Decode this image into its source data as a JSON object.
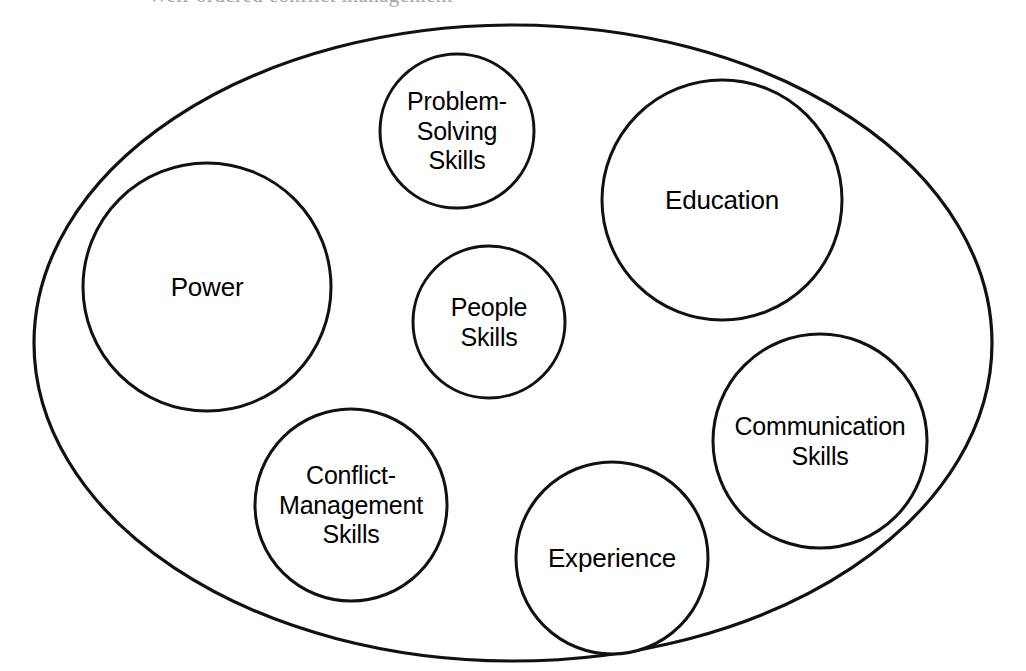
{
  "page": {
    "width": 1026,
    "height": 671,
    "background_color": "#ffffff",
    "stroke_color": "#111111",
    "text_color": "#000000",
    "clipped_header_text": "Well-ordered conflict management"
  },
  "chart_data": {
    "type": "diagram",
    "diagram_kind": "venn-containment",
    "title": "",
    "container": {
      "shape": "ellipse",
      "label": "",
      "cx": 513,
      "cy": 343,
      "rx": 479,
      "ry": 318,
      "stroke_width": 3.2
    },
    "nodes": [
      {
        "id": "power",
        "label": "Power",
        "shape": "circle",
        "cx": 207,
        "cy": 287,
        "r": 124,
        "font_size": 26,
        "stroke_width": 3.0
      },
      {
        "id": "problem-solving-skills",
        "label": "Problem-\nSolving\nSkills",
        "shape": "circle",
        "cx": 457,
        "cy": 131,
        "r": 77,
        "font_size": 25,
        "stroke_width": 3.0
      },
      {
        "id": "education",
        "label": "Education",
        "shape": "circle",
        "cx": 722,
        "cy": 200,
        "r": 120,
        "font_size": 26,
        "stroke_width": 3.0
      },
      {
        "id": "people-skills",
        "label": "People\nSkills",
        "shape": "circle",
        "cx": 489,
        "cy": 322,
        "r": 76,
        "font_size": 25,
        "stroke_width": 3.0
      },
      {
        "id": "communication-skills",
        "label": "Communication\nSkills",
        "shape": "circle",
        "cx": 820,
        "cy": 441,
        "r": 107,
        "font_size": 25,
        "stroke_width": 3.0
      },
      {
        "id": "conflict-management-skills",
        "label": "Conflict-\nManagement\nSkills",
        "shape": "circle",
        "cx": 351,
        "cy": 505,
        "r": 96,
        "font_size": 25,
        "stroke_width": 3.0
      },
      {
        "id": "experience",
        "label": "Experience",
        "shape": "circle",
        "cx": 612,
        "cy": 558,
        "r": 96,
        "font_size": 26,
        "stroke_width": 3.0
      }
    ]
  }
}
